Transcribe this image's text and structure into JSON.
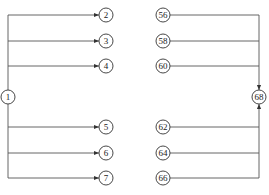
{
  "diagram": {
    "type": "network-flow",
    "line_color": "#555555",
    "node_stroke": "#333333",
    "source": {
      "id": "1",
      "label": "1",
      "x": 8,
      "y": 97
    },
    "sink": {
      "id": "68",
      "label": "68",
      "x": 259,
      "y": 97
    },
    "left_nodes": [
      {
        "label": "2",
        "x": 106,
        "y": 15
      },
      {
        "label": "3",
        "x": 106,
        "y": 41
      },
      {
        "label": "4",
        "x": 106,
        "y": 66
      },
      {
        "label": "5",
        "x": 106,
        "y": 127
      },
      {
        "label": "6",
        "x": 106,
        "y": 153
      },
      {
        "label": "7",
        "x": 106,
        "y": 178
      }
    ],
    "right_nodes": [
      {
        "label": "56",
        "x": 163,
        "y": 15
      },
      {
        "label": "58",
        "x": 163,
        "y": 41
      },
      {
        "label": "60",
        "x": 163,
        "y": 66
      },
      {
        "label": "62",
        "x": 163,
        "y": 127
      },
      {
        "label": "64",
        "x": 163,
        "y": 153
      },
      {
        "label": "66",
        "x": 163,
        "y": 178
      }
    ],
    "edges": [
      {
        "from": "1",
        "to": "2"
      },
      {
        "from": "1",
        "to": "3"
      },
      {
        "from": "1",
        "to": "4"
      },
      {
        "from": "1",
        "to": "5"
      },
      {
        "from": "1",
        "to": "6"
      },
      {
        "from": "1",
        "to": "7"
      },
      {
        "from": "56",
        "to": "68"
      },
      {
        "from": "58",
        "to": "68"
      },
      {
        "from": "60",
        "to": "68"
      },
      {
        "from": "62",
        "to": "68"
      },
      {
        "from": "64",
        "to": "68"
      },
      {
        "from": "66",
        "to": "68"
      }
    ]
  }
}
